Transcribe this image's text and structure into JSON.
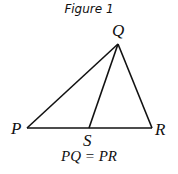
{
  "figure": {
    "title": "Figure 1",
    "caption": "PQ = PR",
    "points": {
      "P": {
        "label": "P",
        "x": 27,
        "y": 128
      },
      "Q": {
        "label": "Q",
        "x": 118,
        "y": 44
      },
      "R": {
        "label": "R",
        "x": 152,
        "y": 128
      },
      "S": {
        "label": "S",
        "x": 89,
        "y": 128
      }
    },
    "segments": [
      "PQ",
      "QR",
      "PR",
      "QS"
    ],
    "line_color": "#111111"
  }
}
